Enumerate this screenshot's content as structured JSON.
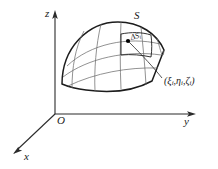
{
  "figure": {
    "axes": {
      "z_label": "z",
      "y_label": "y",
      "x_label": "x",
      "origin_label": "O"
    },
    "labels": {
      "surface": "S",
      "patch_delta": "ΔS",
      "patch_subscript": "i",
      "coordinate_point": "(ξ",
      "coordinate_sub1": "i",
      "coordinate_mid": ",η",
      "coordinate_sub2": "i",
      "coordinate_mid2": ",ζ",
      "coordinate_sub3": "i",
      "coordinate_close": ")",
      "coordinate_full": "(ξᵢ,ηᵢ,ζᵢ)"
    },
    "colors": {
      "outline": "#1c1c1c",
      "mesh": "#6e6e6e",
      "axis": "#2b2b2b",
      "dot": "#000000",
      "background": "#ffffff"
    },
    "geometry": {
      "origin": [
        55,
        114
      ],
      "z_axis_tip": [
        55,
        14
      ],
      "y_axis_tip": [
        193,
        114
      ],
      "x_axis_tip": [
        15,
        152
      ],
      "sample_point": [
        128,
        41
      ]
    }
  }
}
